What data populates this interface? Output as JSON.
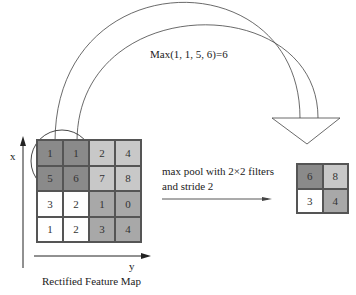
{
  "annotation": {
    "max_formula": "Max(1, 1, 5, 6)=6",
    "operation_label_line1": "max pool with 2×2 filters",
    "operation_label_line2": "and stride 2"
  },
  "input_map": {
    "title": "Rectified Feature Map",
    "axis_x": "x",
    "axis_y": "y",
    "rows": [
      [
        {
          "v": "1",
          "c": "#8a8a8a"
        },
        {
          "v": "1",
          "c": "#8a8a8a"
        },
        {
          "v": "2",
          "c": "#c8c8c8"
        },
        {
          "v": "4",
          "c": "#c8c8c8"
        }
      ],
      [
        {
          "v": "5",
          "c": "#8a8a8a"
        },
        {
          "v": "6",
          "c": "#8a8a8a"
        },
        {
          "v": "7",
          "c": "#c8c8c8"
        },
        {
          "v": "8",
          "c": "#c8c8c8"
        }
      ],
      [
        {
          "v": "3",
          "c": "#ffffff"
        },
        {
          "v": "2",
          "c": "#ffffff"
        },
        {
          "v": "1",
          "c": "#a8a8a8"
        },
        {
          "v": "0",
          "c": "#a8a8a8"
        }
      ],
      [
        {
          "v": "1",
          "c": "#ffffff"
        },
        {
          "v": "2",
          "c": "#ffffff"
        },
        {
          "v": "3",
          "c": "#a8a8a8"
        },
        {
          "v": "4",
          "c": "#a8a8a8"
        }
      ]
    ]
  },
  "output_map": {
    "rows": [
      [
        {
          "v": "6",
          "c": "#8a8a8a"
        },
        {
          "v": "8",
          "c": "#c8c8c8"
        }
      ],
      [
        {
          "v": "3",
          "c": "#ffffff"
        },
        {
          "v": "4",
          "c": "#a8a8a8"
        }
      ]
    ]
  }
}
